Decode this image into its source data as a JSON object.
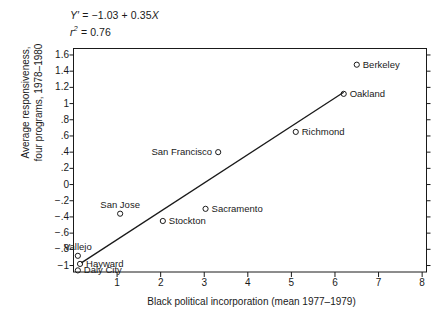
{
  "chart_data": {
    "type": "scatter",
    "title": "",
    "xlabel": "Black political incorporation (mean 1977–1979)",
    "ylabel": "Average responsiveness,\nfour programs, 1978–1980",
    "xlim": [
      0,
      8.1
    ],
    "ylim": [
      -1.08,
      1.68
    ],
    "xticks": [
      "1",
      "2",
      "3",
      "4",
      "5",
      "6",
      "7",
      "8"
    ],
    "xtick_values": [
      1,
      2,
      3,
      4,
      5,
      6,
      7,
      8
    ],
    "yticks": [
      "1.6",
      "1.4",
      "1.2",
      "1",
      ".8",
      ".6",
      ".4",
      ".2",
      "0",
      "−.2",
      "−.4",
      "−.6",
      "−.8",
      "−1"
    ],
    "ytick_values": [
      1.6,
      1.4,
      1.2,
      1,
      0.8,
      0.6,
      0.4,
      0.2,
      0,
      -0.2,
      -0.4,
      -0.6,
      -0.8,
      -1
    ],
    "grid": false,
    "legend": "none",
    "marker": "open-circle",
    "points": [
      {
        "label": "Berkeley",
        "x": 6.5,
        "y": 1.48,
        "label_pos": "right"
      },
      {
        "label": "Oakland",
        "x": 6.2,
        "y": 1.12,
        "label_pos": "right"
      },
      {
        "label": "Richmond",
        "x": 5.1,
        "y": 0.65,
        "label_pos": "right"
      },
      {
        "label": "San Francisco",
        "x": 3.32,
        "y": 0.4,
        "label_pos": "left"
      },
      {
        "label": "Sacramento",
        "x": 3.03,
        "y": -0.3,
        "label_pos": "right"
      },
      {
        "label": "Stockton",
        "x": 2.05,
        "y": -0.45,
        "label_pos": "right"
      },
      {
        "label": "San Jose",
        "x": 1.07,
        "y": -0.36,
        "label_pos": "above"
      },
      {
        "label": "Vallejo",
        "x": 0.1,
        "y": -0.88,
        "label_pos": "above"
      },
      {
        "label": "Hayward",
        "x": 0.15,
        "y": -0.98,
        "label_pos": "right"
      },
      {
        "label": "Daly City",
        "x": 0.1,
        "y": -1.06,
        "label_pos": "right"
      }
    ],
    "fit_line": {
      "intercept": -1.03,
      "slope": 0.35,
      "x_start": 0.18,
      "x_end": 6.2
    },
    "annotations": {
      "equation_lhs": "Y′",
      "equation": " = −1.03 + 0.35",
      "equation_x": "X",
      "r_symbol": "r",
      "r_sup": "2",
      "r_value": " = 0.76"
    }
  }
}
